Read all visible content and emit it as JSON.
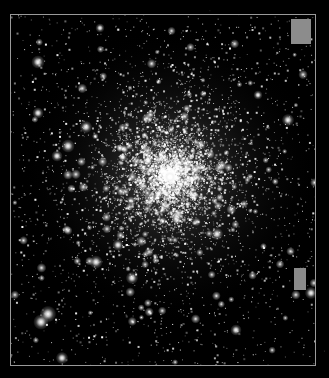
{
  "image": {
    "subject": "globular star cluster",
    "width": 329,
    "height": 378,
    "background_color": "#000000",
    "frame": {
      "x": 10,
      "y": 14,
      "width": 306,
      "height": 352,
      "color": "#9a9a9a"
    },
    "cluster": {
      "center_x": 170,
      "center_y": 175,
      "core_radius": 38,
      "halo_radius": 150,
      "star_count": 5200,
      "field_star_count": 1400
    },
    "patches": [
      {
        "name": "gray-rectangle-top-right",
        "x": 291,
        "y": 19,
        "width": 20,
        "height": 25,
        "color": "#8c8c8c"
      },
      {
        "name": "gray-rectangle-lower-right",
        "x": 294,
        "y": 268,
        "width": 12,
        "height": 22,
        "color": "#8a8a8a"
      }
    ],
    "bright_stars": [
      {
        "x": 48,
        "y": 314,
        "r": 3.2
      },
      {
        "x": 41,
        "y": 322,
        "r": 3.0
      },
      {
        "x": 38,
        "y": 62,
        "r": 2.6
      },
      {
        "x": 38,
        "y": 113,
        "r": 2.2
      },
      {
        "x": 86,
        "y": 127,
        "r": 2.4
      },
      {
        "x": 68,
        "y": 146,
        "r": 2.6
      },
      {
        "x": 57,
        "y": 156,
        "r": 2.2
      },
      {
        "x": 96,
        "y": 262,
        "r": 2.6
      },
      {
        "x": 118,
        "y": 245,
        "r": 2.2
      },
      {
        "x": 132,
        "y": 278,
        "r": 2.4
      },
      {
        "x": 217,
        "y": 234,
        "r": 2.4
      },
      {
        "x": 288,
        "y": 120,
        "r": 2.4
      },
      {
        "x": 311,
        "y": 293,
        "r": 2.4
      },
      {
        "x": 170,
        "y": 177,
        "r": 2.4
      },
      {
        "x": 148,
        "y": 160,
        "r": 2.0
      },
      {
        "x": 195,
        "y": 170,
        "r": 2.0
      },
      {
        "x": 62,
        "y": 358,
        "r": 2.4
      },
      {
        "x": 236,
        "y": 330,
        "r": 2.2
      },
      {
        "x": 100,
        "y": 28,
        "r": 1.8
      },
      {
        "x": 258,
        "y": 95,
        "r": 1.8
      }
    ]
  }
}
